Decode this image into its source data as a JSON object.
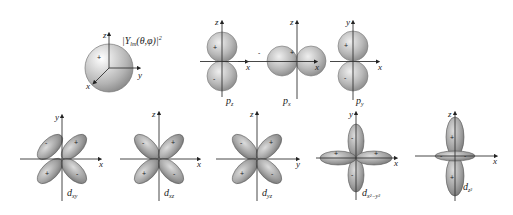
{
  "figure": {
    "sphere": {
      "label": "|Y",
      "label_sub": "lm",
      "label_rest": "(θ,φ)|",
      "label_sup": "2",
      "axes": {
        "z": "z",
        "y": "y",
        "x": "x"
      },
      "sign": "+"
    },
    "p_orbitals": [
      {
        "name": "p",
        "sub": "z",
        "axes": {
          "vertical": "z",
          "horizontal": "x"
        },
        "signs": [
          "+",
          "-"
        ]
      },
      {
        "name": "p",
        "sub": "x",
        "axes": {
          "vertical": "z",
          "horizontal": "x"
        },
        "signs": [
          "-",
          "+"
        ]
      },
      {
        "name": "p",
        "sub": "y",
        "axes": {
          "vertical": "y",
          "horizontal": "x"
        },
        "signs": [
          "+",
          "-"
        ]
      }
    ],
    "d_orbitals": [
      {
        "name": "d",
        "sub": "xy",
        "axes": {
          "vertical": "y",
          "horizontal": "x"
        },
        "signs": [
          "-",
          "+",
          "+",
          "-"
        ]
      },
      {
        "name": "d",
        "sub": "xz",
        "axes": {
          "vertical": "z",
          "horizontal": "x"
        },
        "signs": [
          "-",
          "+",
          "+",
          "-"
        ]
      },
      {
        "name": "d",
        "sub": "yz",
        "axes": {
          "vertical": "z",
          "horizontal": "y"
        },
        "signs": [
          "-",
          "+",
          "+",
          "-"
        ]
      },
      {
        "name": "d",
        "sub": "x²−y²",
        "axes": {
          "vertical": "y",
          "horizontal": "x"
        },
        "signs": [
          "-",
          "+",
          "+",
          "-"
        ]
      },
      {
        "name": "d",
        "sub": "z²",
        "axes": {
          "vertical": "z",
          "horizontal": "x"
        },
        "signs": [
          "+",
          "-",
          "-",
          "+"
        ]
      }
    ]
  }
}
